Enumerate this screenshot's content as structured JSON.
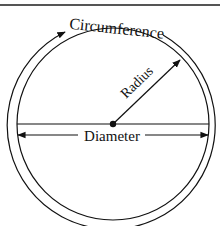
{
  "diagram": {
    "labels": {
      "circumference": "Circumference",
      "radius": "Radius",
      "diameter": "Diameter"
    },
    "colors": {
      "stroke": "#111111",
      "border": "#555555",
      "background": "#ffffff"
    }
  }
}
